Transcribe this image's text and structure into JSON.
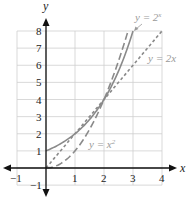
{
  "chart_data": {
    "type": "line",
    "title": "",
    "xlabel": "x",
    "ylabel": "y",
    "xlim": [
      -1,
      4
    ],
    "ylim": [
      -1,
      8
    ],
    "grid": true,
    "x_ticks": [
      "-1",
      "1",
      "2",
      "3",
      "4"
    ],
    "y_ticks": [
      "-1",
      "1",
      "2",
      "3",
      "4",
      "5",
      "6",
      "7",
      "8"
    ],
    "series": [
      {
        "name": "y = 2^x",
        "label_text": "y = 2",
        "label_sup": "x",
        "style": "solid",
        "x": [
          0,
          0.5,
          1,
          1.5,
          2,
          2.5,
          3
        ],
        "y": [
          1,
          1.41,
          2,
          2.83,
          4,
          5.66,
          8
        ]
      },
      {
        "name": "y = 2x",
        "label_text": "y = 2x",
        "style": "short-dash",
        "x": [
          0,
          1,
          2,
          3,
          4
        ],
        "y": [
          0,
          2,
          4,
          6,
          8
        ]
      },
      {
        "name": "y = x^2",
        "label_text": "y = x",
        "label_sup": "2",
        "style": "long-dash",
        "x": [
          0,
          0.5,
          1,
          1.5,
          2,
          2.5,
          2.83
        ],
        "y": [
          0,
          0.25,
          1,
          2.25,
          4,
          6.25,
          8
        ]
      }
    ],
    "annotations": [
      "Curves intersect at (2, 4)"
    ],
    "colors": {
      "grid": "#c8c8c8",
      "axes": "#111111",
      "curves": "#8a8a8a",
      "labels": "#9a9a9a"
    }
  }
}
